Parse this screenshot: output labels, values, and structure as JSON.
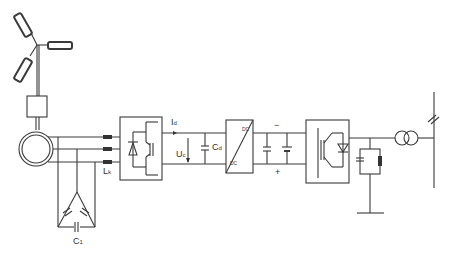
{
  "diagram": {
    "labels": {
      "id_main": "I",
      "id_sub": "d",
      "uc_main": "U",
      "uc_sub": "c",
      "cd_main": "C",
      "cd_sub": "d",
      "lk_main": "L",
      "lk_sub": "k",
      "c1_main": "C",
      "c1_sub": "1",
      "dc_top": "DC",
      "dc_bottom": "DC",
      "minus": "−",
      "plus": "+"
    }
  }
}
